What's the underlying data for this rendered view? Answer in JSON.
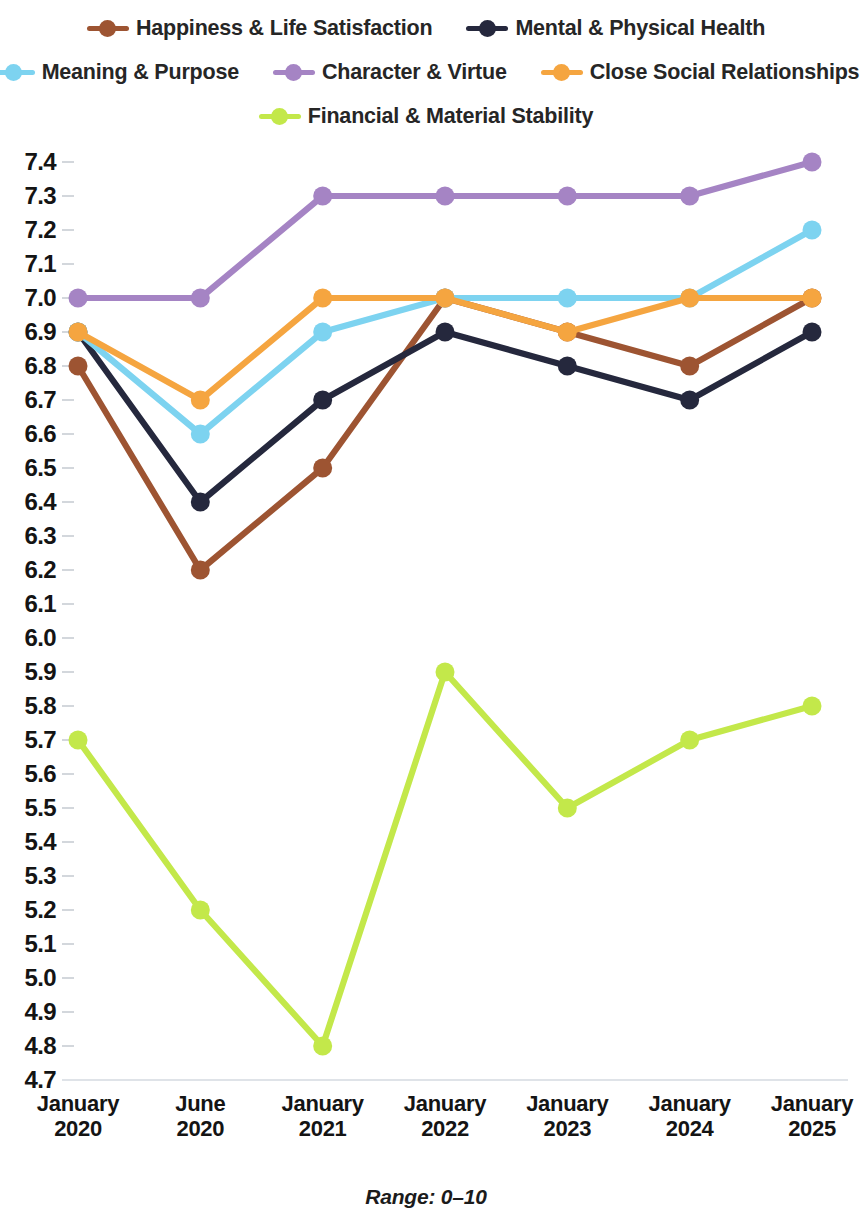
{
  "legend": {
    "rows": [
      [
        {
          "label": "Happiness & Life Satisfaction",
          "color": "#9d5432",
          "key": "happiness"
        },
        {
          "label": "Mental & Physical Health",
          "color": "#25283d",
          "key": "health"
        }
      ],
      [
        {
          "label": "Meaning & Purpose",
          "color": "#7dd3f0",
          "key": "meaning"
        },
        {
          "label": "Character & Virtue",
          "color": "#a584c4",
          "key": "character"
        },
        {
          "label": "Close Social Relationships",
          "color": "#f5a540",
          "key": "relationships"
        }
      ],
      [
        {
          "label": "Financial & Material Stability",
          "color": "#c3e84a",
          "key": "financial"
        }
      ]
    ]
  },
  "caption": "Range: 0–10",
  "chart_data": {
    "type": "line",
    "title": "",
    "subtitle": "",
    "xlabel": "",
    "ylabel": "",
    "note": "Range: 0–10",
    "grid": false,
    "legend_position": "top",
    "categories": [
      "January 2020",
      "June 2020",
      "January 2021",
      "January 2022",
      "January 2023",
      "January 2024",
      "January 2025"
    ],
    "category_lines": [
      [
        "January",
        "2020"
      ],
      [
        "June",
        "2020"
      ],
      [
        "January",
        "2021"
      ],
      [
        "January",
        "2022"
      ],
      [
        "January",
        "2023"
      ],
      [
        "January",
        "2024"
      ],
      [
        "January",
        "2025"
      ]
    ],
    "ylim": [
      4.7,
      7.4
    ],
    "ytick_step": 0.1,
    "ytick_labels": [
      "7.4",
      "7.3",
      "7.2",
      "7.1",
      "7.0",
      "6.9",
      "6.8",
      "6.7",
      "6.6",
      "6.5",
      "6.4",
      "6.3",
      "6.2",
      "6.1",
      "6.0",
      "5.9",
      "5.8",
      "5.7",
      "5.6",
      "5.5",
      "5.4",
      "5.3",
      "5.2",
      "5.1",
      "5.0",
      "4.9",
      "4.8",
      "4.7"
    ],
    "series": [
      {
        "name": "Happiness & Life Satisfaction",
        "color": "#9d5432",
        "values": [
          6.8,
          6.2,
          6.5,
          7.0,
          6.9,
          6.8,
          7.0
        ]
      },
      {
        "name": "Mental & Physical Health",
        "color": "#25283d",
        "values": [
          6.9,
          6.4,
          6.7,
          6.9,
          6.8,
          6.7,
          6.9
        ]
      },
      {
        "name": "Meaning & Purpose",
        "color": "#7dd3f0",
        "values": [
          6.9,
          6.6,
          6.9,
          7.0,
          7.0,
          7.0,
          7.2
        ]
      },
      {
        "name": "Character & Virtue",
        "color": "#a584c4",
        "values": [
          7.0,
          7.0,
          7.3,
          7.3,
          7.3,
          7.3,
          7.4
        ]
      },
      {
        "name": "Close Social Relationships",
        "color": "#f5a540",
        "values": [
          6.9,
          6.7,
          7.0,
          7.0,
          6.9,
          7.0,
          7.0
        ]
      },
      {
        "name": "Financial & Material Stability",
        "color": "#c3e84a",
        "values": [
          5.7,
          5.2,
          4.8,
          5.9,
          5.5,
          5.7,
          5.8
        ]
      }
    ]
  }
}
